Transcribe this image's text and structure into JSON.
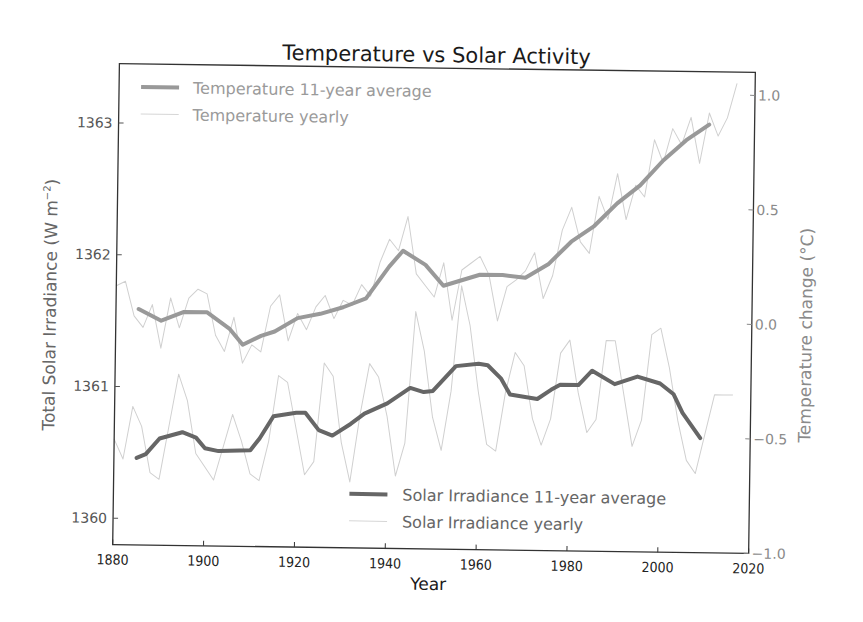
{
  "chart_data": {
    "type": "line",
    "title": "Temperature vs Solar Activity",
    "xlabel": "Year",
    "ylabel_left": "Total Solar Irradiance (W m⁻²)",
    "ylabel_right": "Temperature change (°C)",
    "xlim": [
      1880,
      2020
    ],
    "ylim_left": [
      1359.8,
      1363.45
    ],
    "ylim_right": [
      -1.0,
      1.1
    ],
    "x_ticks": [
      "1880",
      "1900",
      "1920",
      "1940",
      "1960",
      "1980",
      "2000",
      "2020"
    ],
    "y_ticks_left": [
      "1360",
      "1361",
      "1362",
      "1363"
    ],
    "y_ticks_right": [
      "−1.0",
      "−0.5",
      "0.0",
      "0.5",
      "1.0"
    ],
    "grid": false,
    "legends": [
      {
        "position": "upper left",
        "entries": [
          "Temperature 11-year average",
          "Temperature yearly"
        ]
      },
      {
        "position": "lower right",
        "entries": [
          "Solar Irradiance 11-year average",
          "Solar Irradiance yearly"
        ]
      }
    ],
    "series": [
      {
        "name": "Temperature 11-year average",
        "axis": "right",
        "color": "#999999",
        "width": 4,
        "x": [
          1885,
          1890,
          1895,
          1900,
          1905,
          1908,
          1912,
          1915,
          1920,
          1925,
          1930,
          1935,
          1940,
          1943,
          1948,
          1952,
          1960,
          1965,
          1970,
          1975,
          1980,
          1985,
          1990,
          1995,
          2000,
          2005,
          2010
        ],
        "values": [
          0.03,
          -0.02,
          0.02,
          0.02,
          -0.05,
          -0.12,
          -0.08,
          -0.06,
          0.0,
          0.02,
          0.05,
          0.09,
          0.23,
          0.3,
          0.24,
          0.15,
          0.2,
          0.2,
          0.19,
          0.25,
          0.35,
          0.42,
          0.52,
          0.6,
          0.71,
          0.8,
          0.87
        ]
      },
      {
        "name": "Temperature yearly",
        "axis": "right",
        "color": "#d0d0d0",
        "width": 1,
        "x": [
          1880,
          1882,
          1884,
          1886,
          1888,
          1890,
          1892,
          1894,
          1896,
          1898,
          1900,
          1902,
          1904,
          1906,
          1908,
          1910,
          1912,
          1914,
          1916,
          1918,
          1920,
          1922,
          1924,
          1926,
          1928,
          1930,
          1932,
          1934,
          1936,
          1938,
          1940,
          1942,
          1944,
          1946,
          1948,
          1950,
          1952,
          1954,
          1956,
          1958,
          1960,
          1962,
          1964,
          1966,
          1968,
          1970,
          1972,
          1974,
          1976,
          1978,
          1980,
          1982,
          1984,
          1986,
          1988,
          1990,
          1992,
          1994,
          1996,
          1998,
          2000,
          2002,
          2004,
          2006,
          2008,
          2010,
          2012,
          2014,
          2016
        ],
        "values": [
          0.13,
          0.15,
          0.0,
          -0.05,
          0.05,
          -0.14,
          0.08,
          -0.05,
          0.08,
          0.12,
          0.1,
          -0.08,
          -0.15,
          0.0,
          -0.2,
          -0.12,
          -0.15,
          0.05,
          0.1,
          -0.1,
          0.02,
          -0.05,
          0.05,
          0.1,
          0.0,
          0.08,
          0.06,
          0.15,
          0.1,
          0.25,
          0.35,
          0.3,
          0.45,
          0.2,
          0.15,
          0.1,
          0.25,
          0.0,
          0.22,
          0.25,
          0.28,
          0.2,
          0.0,
          0.15,
          0.18,
          0.22,
          0.3,
          0.1,
          0.2,
          0.4,
          0.5,
          0.35,
          0.3,
          0.55,
          0.45,
          0.65,
          0.45,
          0.6,
          0.55,
          0.8,
          0.7,
          0.85,
          0.78,
          0.9,
          0.7,
          0.92,
          0.82,
          0.9,
          1.05
        ]
      },
      {
        "name": "Solar Irradiance 11-year average",
        "axis": "left",
        "color": "#666666",
        "width": 4,
        "x": [
          1885,
          1887,
          1890,
          1895,
          1898,
          1900,
          1903,
          1910,
          1912,
          1915,
          1920,
          1922,
          1925,
          1928,
          1932,
          1935,
          1940,
          1945,
          1948,
          1950,
          1955,
          1960,
          1962,
          1965,
          1967,
          1973,
          1976,
          1978,
          1982,
          1985,
          1990,
          1995,
          2000,
          2003,
          2005,
          2009
        ],
        "values": [
          1360.46,
          1360.49,
          1360.61,
          1360.66,
          1360.62,
          1360.54,
          1360.52,
          1360.53,
          1360.62,
          1360.79,
          1360.82,
          1360.82,
          1360.69,
          1360.65,
          1360.74,
          1360.82,
          1360.9,
          1361.02,
          1360.99,
          1361.0,
          1361.19,
          1361.21,
          1361.2,
          1361.1,
          1360.98,
          1360.95,
          1361.02,
          1361.06,
          1361.06,
          1361.17,
          1361.07,
          1361.13,
          1361.08,
          1361.0,
          1360.86,
          1360.67
        ]
      },
      {
        "name": "Solar Irradiance yearly",
        "axis": "left",
        "color": "#d0d0d0",
        "width": 1,
        "x": [
          1880,
          1882,
          1884,
          1886,
          1888,
          1890,
          1892,
          1894,
          1896,
          1898,
          1900,
          1902,
          1904,
          1906,
          1908,
          1910,
          1912,
          1914,
          1916,
          1918,
          1920,
          1922,
          1924,
          1926,
          1928,
          1930,
          1932,
          1934,
          1936,
          1938,
          1940,
          1942,
          1944,
          1946,
          1948,
          1950,
          1952,
          1954,
          1956,
          1958,
          1960,
          1962,
          1964,
          1966,
          1968,
          1970,
          1972,
          1974,
          1976,
          1978,
          1980,
          1982,
          1984,
          1986,
          1988,
          1990,
          1992,
          1994,
          1996,
          1998,
          2000,
          2002,
          2004,
          2006,
          2008,
          2010,
          2012,
          2014,
          2016
        ],
        "values": [
          1360.6,
          1360.45,
          1360.85,
          1360.7,
          1360.35,
          1360.3,
          1360.7,
          1361.1,
          1360.9,
          1360.5,
          1360.4,
          1360.3,
          1360.55,
          1360.8,
          1360.6,
          1360.35,
          1360.3,
          1360.6,
          1361.1,
          1361.05,
          1360.7,
          1360.35,
          1360.45,
          1361.2,
          1361.1,
          1360.6,
          1360.3,
          1360.8,
          1361.2,
          1361.1,
          1360.8,
          1360.35,
          1360.6,
          1361.6,
          1361.3,
          1360.8,
          1360.55,
          1361.0,
          1361.8,
          1361.5,
          1361.0,
          1360.6,
          1360.55,
          1361.0,
          1361.3,
          1361.2,
          1360.8,
          1360.6,
          1360.8,
          1361.3,
          1361.4,
          1361.0,
          1360.7,
          1360.8,
          1361.4,
          1361.4,
          1361.0,
          1360.6,
          1360.8,
          1361.45,
          1361.5,
          1361.2,
          1360.8,
          1360.5,
          1360.4,
          1360.7,
          1361.0,
          1361.0,
          1361.0
        ]
      }
    ]
  },
  "title": "Temperature vs Solar Activity",
  "axes": {
    "xlabel": "Year",
    "ylabel_left": "Total Solar Irradiance (W m",
    "ylabel_left_sup": "−2",
    "ylabel_left_close": ")",
    "ylabel_right": "Temperature change (°C)"
  },
  "legend_top": {
    "entry1": "Temperature 11-year average",
    "entry2": "Temperature yearly"
  },
  "legend_bottom": {
    "entry1": "Solar Irradiance 11-year average",
    "entry2": "Solar Irradiance yearly"
  }
}
